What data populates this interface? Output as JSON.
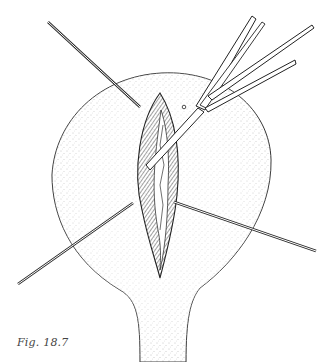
{
  "figure": {
    "caption": "Fig. 18.7",
    "colors": {
      "line": "#2a2a2a",
      "stipple": "#555555",
      "background": "#ffffff"
    }
  }
}
